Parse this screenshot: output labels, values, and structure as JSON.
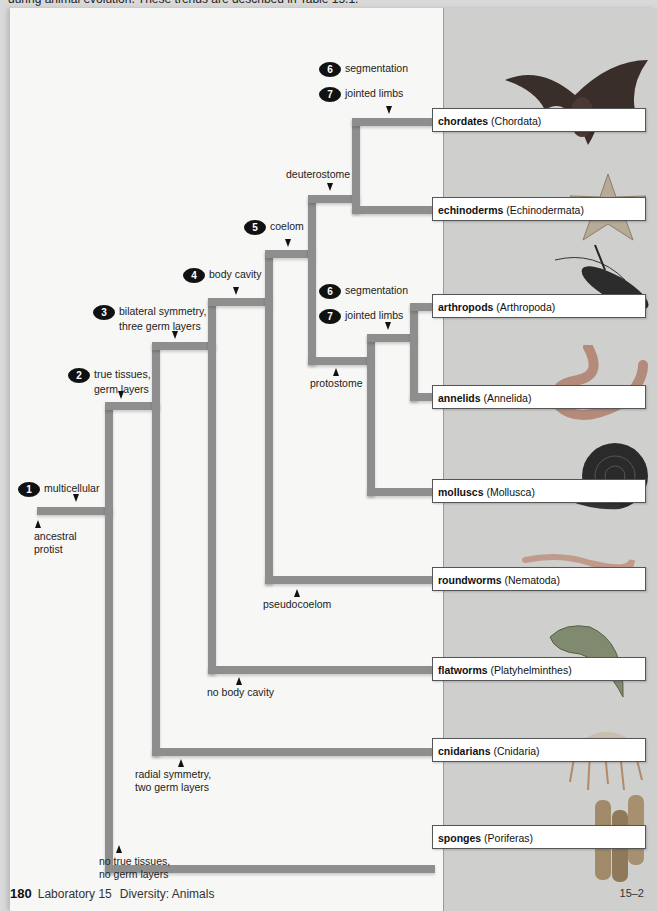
{
  "header": {
    "cut_text": "during animal evolution. These trends are described in Table 15.1."
  },
  "characters": [
    {
      "num": "1",
      "text": "multicellular"
    },
    {
      "num": "2",
      "text": "true tissues,",
      "text2": "germ layers"
    },
    {
      "num": "3",
      "text": "bilateral symmetry,",
      "text2": "three germ layers"
    },
    {
      "num": "4",
      "text": "body cavity"
    },
    {
      "num": "5",
      "text": "coelom"
    },
    {
      "num": "6",
      "text": "segmentation"
    },
    {
      "num": "7",
      "text": "jointed limbs"
    },
    {
      "num": "6",
      "text": "segmentation"
    },
    {
      "num": "7",
      "text": "jointed limbs"
    }
  ],
  "annotations": {
    "ancestral": [
      "ancestral",
      "protist"
    ],
    "deuterostome": "deuterostome",
    "protostome": "protostome",
    "pseudocoelom": "pseudocoelom",
    "no_body_cavity": "no body cavity",
    "radial": [
      "radial symmetry,",
      "two germ layers"
    ],
    "no_true_tissues": [
      "no true tissues,",
      "no germ layers"
    ]
  },
  "taxa": [
    {
      "common": "chordates",
      "scientific": "(Chordata)",
      "icon": "bat"
    },
    {
      "common": "echinoderms",
      "scientific": "(Echinodermata)",
      "icon": "starfish"
    },
    {
      "common": "arthropods",
      "scientific": "(Arthropoda)",
      "icon": "lobster"
    },
    {
      "common": "annelids",
      "scientific": "(Annelida)",
      "icon": "earthworm"
    },
    {
      "common": "molluscs",
      "scientific": "(Mollusca)",
      "icon": "snail"
    },
    {
      "common": "roundworms",
      "scientific": "(Nematoda)",
      "icon": "roundworm"
    },
    {
      "common": "flatworms",
      "scientific": "(Platyhelminthes)",
      "icon": "flatworm"
    },
    {
      "common": "cnidarians",
      "scientific": "(Cnidaria)",
      "icon": "jellyfish"
    },
    {
      "common": "sponges",
      "scientific": "(Poriferas)",
      "icon": "sponge"
    }
  ],
  "footer": {
    "page": "180",
    "lab": "Laboratory 15",
    "section": "Diversity: Animals",
    "figure_ref": "15–2"
  },
  "colors": {
    "branch": "#8e8e8e",
    "panel": "#cfcfcd",
    "page": "#f7f7f5"
  }
}
